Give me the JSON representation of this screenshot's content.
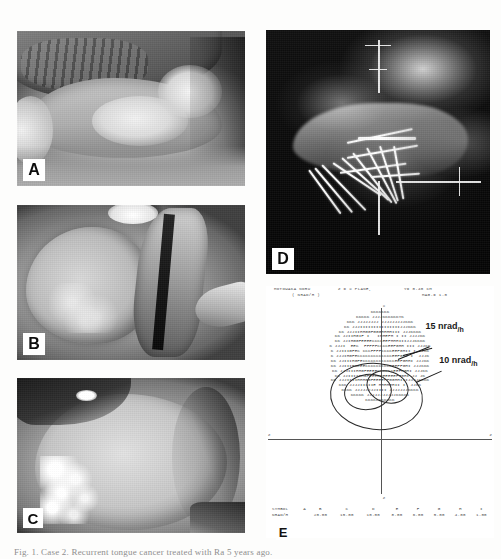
{
  "figure": {
    "caption": "Fig. 1.  Case 2. Recurrent tongue cancer treated with Ra 5 years ago.",
    "panels": [
      {
        "id": "A",
        "label": "A",
        "kind": "clinical-photograph",
        "description": "Lateral view of tongue showing exophytic granular lesion on right lateral border"
      },
      {
        "id": "B",
        "label": "B",
        "kind": "clinical-photograph",
        "description": "Intraoral retracted view of the lesion and floor of mouth"
      },
      {
        "id": "C",
        "label": "C",
        "kind": "clinical-photograph",
        "description": "Protruded tongue showing extent of the indurated tumour mass"
      },
      {
        "id": "D",
        "label": "D",
        "kind": "radiograph",
        "description": "Lateral radiograph showing radium needle implant in situ"
      },
      {
        "id": "E",
        "label": "E",
        "kind": "isodose-computer-printout",
        "description": "Computer printed dose rate distribution in the implant plane"
      }
    ]
  },
  "isodose": {
    "header": {
      "patient_name": "MOTOWAKA NORU",
      "unit": "( NRAD/H )",
      "plane": "Z = X PLANE,",
      "offset": "Y= 0.40 CM",
      "magnification": "MAG.= 1.0"
    },
    "annotations": [
      {
        "text": "15 nrad",
        "unit": "/h",
        "id": "15-nrad-per-hour"
      },
      {
        "text": "10 nrad",
        "unit": "/h",
        "id": "10-nrad-per-hour"
      }
    ],
    "axes": {
      "vertical_label": "X",
      "horizontal_label": "Z",
      "bottom_label": "Z"
    },
    "legend": {
      "row_labels": [
        "SYMBOL",
        "NRAD/H"
      ],
      "symbols": [
        "A",
        "B",
        "C",
        "D",
        "E",
        "F",
        "G",
        "H",
        "I"
      ],
      "values": [
        "20.00",
        "15.00",
        "10.00",
        "8.00",
        "6.00",
        "5.00",
        "4.00",
        "1.00"
      ]
    },
    "map_rows": [
      "KKKKKKK",
      "KKKKK JJJJKKKKKKYK",
      "KKK JJJJJJJJ JJJJJJJJJKKK",
      "KK JJJIIIIIIIIIIIIIIIJJJKKK",
      "KK JJJIIHHGGFGGGHHHHIII JJJKKKK",
      "KK JJIIHGIF I   IHHEFH I II JJJJKK",
      "KK JJIHGGFEEEECCCCEEFHHHIIIJJJKKKK",
      "K JJJI  EEC  FFFFFCCCCEEFGHH III JJJKK",
      "K JJIIIGFEC CCCFFFFCCCCEEFGHII I  JKK",
      "K JJJIHGFECCCCCCCCCCCCCEEFGHI I  JJJK",
      "KK JJIIIHGFECCCCCCCCCCCCEEFGHHI JJJKK",
      "KK JJIIIHGEEECCCCCCCCCEEEFFGHI JJJKKK",
      "KK JJJIIIHHGFEEEECCCCCCEEFFGHI JJJKK",
      "KK JJIIIIHHGFEEEEEEEEEEFFGHI JJ JK",
      "KK JJJIIIIHHHGGFEEEEFFGGHHIIIJJJJAKKK",
      "KKK JJJJIIIIIE HHHHHHII I  JJKK",
      "KKKK JJJJJJJJIIII JJJJJJJKKKK",
      "KKKKK JJJJJJJJJJJKKKKK",
      "KKKKKKKKKKK"
    ]
  }
}
